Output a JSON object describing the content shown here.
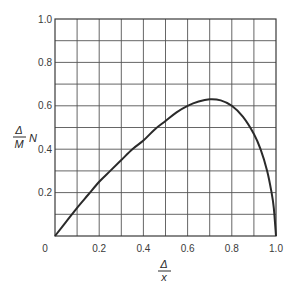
{
  "chart_data": {
    "type": "line",
    "title": "",
    "xlabel": "Δ / x",
    "ylabel": "Δ / M · N",
    "xlabel_parts": {
      "numerator": "Δ",
      "denominator": "x"
    },
    "ylabel_parts": {
      "numerator": "Δ",
      "denominator": "M",
      "suffix": "N"
    },
    "xlim": [
      0,
      1.0
    ],
    "ylim": [
      0,
      1.0
    ],
    "grid": true,
    "x_grid_step": 0.1,
    "y_grid_step": 0.1,
    "x_ticks": [
      "0",
      "0.2",
      "0.4",
      "0.6",
      "0.8",
      "1.0"
    ],
    "y_ticks": [
      "0.2",
      "0.4",
      "0.6",
      "0.8",
      "1.0"
    ],
    "origin_label": "0",
    "series": [
      {
        "name": "curve",
        "x": [
          0,
          0.05,
          0.1,
          0.15,
          0.2,
          0.25,
          0.3,
          0.35,
          0.4,
          0.45,
          0.5,
          0.55,
          0.6,
          0.65,
          0.7,
          0.75,
          0.8,
          0.85,
          0.9,
          0.93,
          0.96,
          0.98,
          0.99,
          1.0
        ],
        "values": [
          0,
          0.065,
          0.13,
          0.19,
          0.25,
          0.3,
          0.35,
          0.4,
          0.44,
          0.49,
          0.53,
          0.57,
          0.6,
          0.62,
          0.63,
          0.625,
          0.6,
          0.55,
          0.47,
          0.4,
          0.3,
          0.2,
          0.13,
          0
        ]
      }
    ],
    "legend": null
  }
}
